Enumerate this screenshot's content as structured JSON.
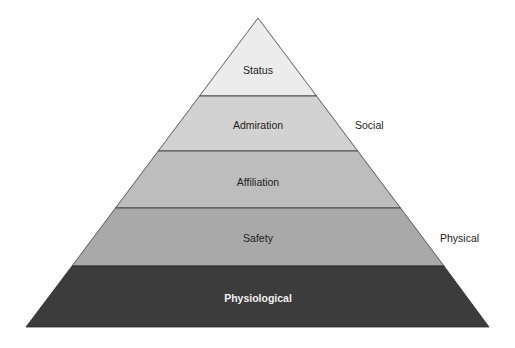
{
  "diagram": {
    "type": "pyramid",
    "levels": [
      {
        "label": "Status",
        "fill": "#ececec"
      },
      {
        "label": "Admiration",
        "fill": "#d2d2d2"
      },
      {
        "label": "Affiliation",
        "fill": "#bdbdbd"
      },
      {
        "label": "Safety",
        "fill": "#a9a9a9"
      },
      {
        "label": "Physiological",
        "fill": "#3c3c3c"
      }
    ],
    "side_labels": [
      {
        "label": "Social"
      },
      {
        "label": "Physical"
      }
    ],
    "colors": {
      "outline": "#333333",
      "text": "#222222",
      "text_on_dark": "#f0f0f0"
    }
  }
}
